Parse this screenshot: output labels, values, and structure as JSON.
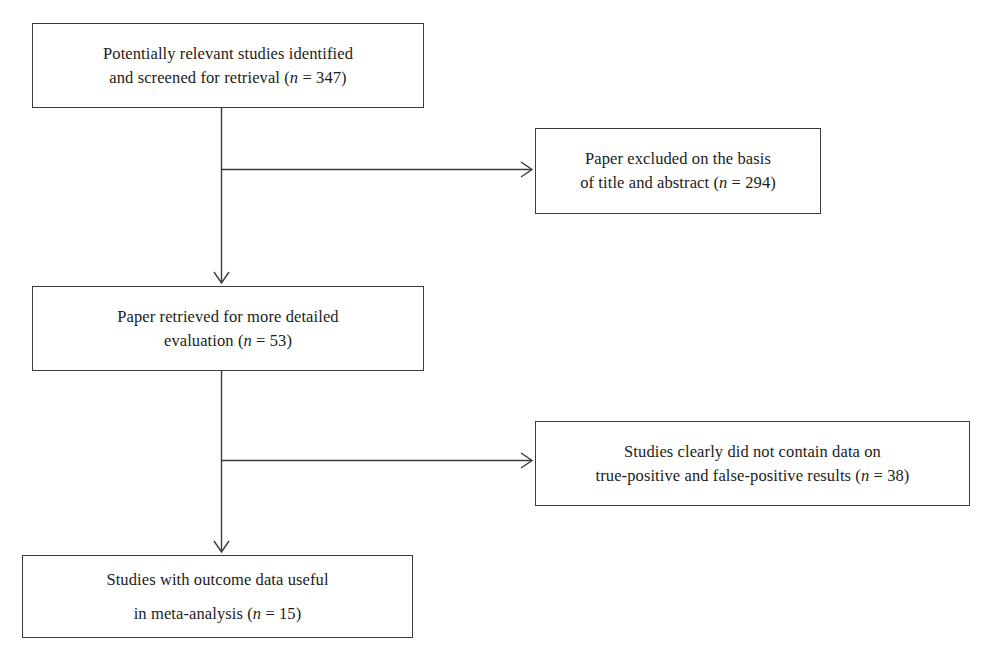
{
  "diagram": {
    "type": "prisma-flowchart",
    "line_color": "#3a3a40",
    "text_color": "#1c1c20",
    "background": "#ffffff",
    "nodes": [
      {
        "id": "identified",
        "name": "potentially-relevant-studies-box",
        "text": "Potentially relevant studies identified\nand screened for retrieval (n = 347)",
        "count_label": "n = 347",
        "count": 347
      },
      {
        "id": "excluded",
        "name": "paper-excluded-box",
        "text": "Paper excluded on the basis\nof title and abstract (n = 294)",
        "count_label": "n = 294",
        "count": 294
      },
      {
        "id": "retrieved",
        "name": "paper-retrieved-box",
        "text": "Paper retrieved for more detailed\nevaluation (n = 53)",
        "count_label": "n = 53",
        "count": 53
      },
      {
        "id": "nodata",
        "name": "studies-no-data-box",
        "text": "Studies clearly did not contain data on\ntrue-positive and false-positive results (n = 38)",
        "count_label": "n = 38",
        "count": 38
      },
      {
        "id": "useful",
        "name": "studies-useful-box",
        "text": "Studies with outcome data useful\nin meta-analysis (n = 15)",
        "count_label": "n = 15",
        "count": 15
      }
    ],
    "edges": [
      {
        "id": "identified-to-excluded",
        "from": "identified",
        "to": "excluded",
        "direction": "right"
      },
      {
        "id": "identified-to-retrieved",
        "from": "identified",
        "to": "retrieved",
        "direction": "down"
      },
      {
        "id": "retrieved-to-nodata",
        "from": "retrieved",
        "to": "nodata",
        "direction": "right"
      },
      {
        "id": "retrieved-to-useful",
        "from": "retrieved",
        "to": "useful",
        "direction": "down"
      }
    ]
  }
}
